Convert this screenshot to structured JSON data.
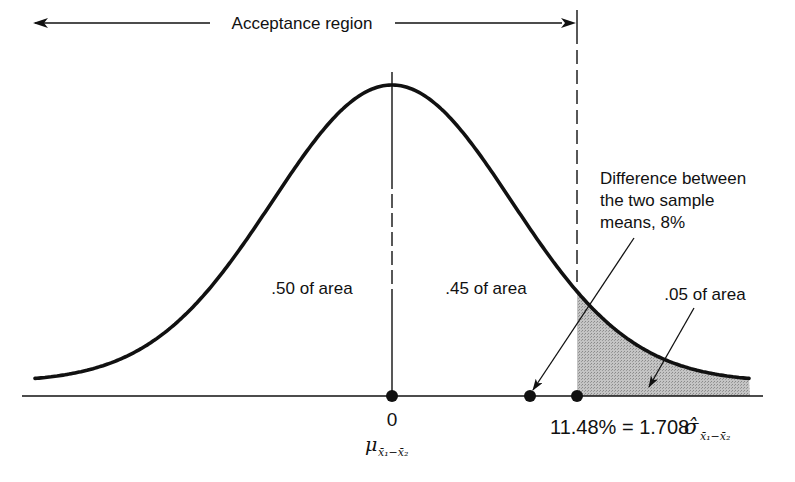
{
  "figure": {
    "type": "normal distribution hypothesis test diagram",
    "acceptance_label": "Acceptance region",
    "left_area_label": ".50 of area",
    "middle_area_label": ".45 of area",
    "tail_area_label": ".05 of area",
    "difference_label_lines": [
      "Difference between",
      "the two sample",
      "means,  8%"
    ],
    "zero_label": "0",
    "mean_symbol": "μ",
    "mean_subscript": "x̄₁−x̄₂",
    "critical_value_label": "11.48% = 1.708",
    "critical_sigma_symbol": "σ̂",
    "critical_sigma_subscript": "x̄₁−x̄₂",
    "colors": {
      "ink": "#111111",
      "shade": "#b3b3b3",
      "background": "#ffffff"
    }
  },
  "chart_data": {
    "type": "area",
    "title": "",
    "distribution": "normal",
    "center": 0,
    "critical_value_percent": 11.48,
    "critical_value_sigma_multiple": 1.708,
    "observed_difference_percent": 8,
    "regions": [
      {
        "name": "left half",
        "area": 0.5
      },
      {
        "name": "center to critical value",
        "area": 0.45
      },
      {
        "name": "rejection tail",
        "area": 0.05,
        "shaded": true
      }
    ],
    "points_on_axis": [
      {
        "label": "0 (μ x̄1−x̄2)",
        "value": 0
      },
      {
        "label": "Difference between the two sample means, 8%",
        "value": 8
      },
      {
        "label": "11.48% = 1.708 σ̂ x̄1−x̄2",
        "value": 11.48
      }
    ],
    "annotations": [
      "Acceptance region",
      ".50 of area",
      ".45 of area",
      ".05 of area",
      "Difference between the two sample means, 8%"
    ]
  }
}
